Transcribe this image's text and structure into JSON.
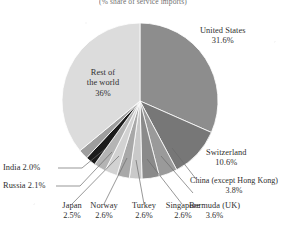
{
  "chart_data": {
    "type": "pie",
    "title": "(% share of service imports)",
    "xlabel": "",
    "ylabel": "",
    "legend_position": "none",
    "grid": false,
    "categories": [
      "United States",
      "Switzerland",
      "China (except Hong Kong)",
      "Bermuda (UK)",
      "Singapore",
      "Turkey",
      "Norway",
      "Japan",
      "Russia",
      "India",
      "Rest of the world"
    ],
    "values": [
      31.6,
      10.6,
      3.8,
      3.6,
      2.6,
      2.6,
      2.6,
      2.5,
      2.1,
      2.0,
      36.0
    ],
    "value_labels": [
      "31.6%",
      "10.6%",
      "3.8%",
      "3.6%",
      "2.6%",
      "2.6%",
      "2.6%",
      "2.5%",
      "2.1%",
      "2.0%",
      "36%"
    ],
    "colors": [
      "#8d8d8d",
      "#777777",
      "#9a9a9a",
      "#8a8a8a",
      "#c9c9c9",
      "#a8a8a8",
      "#d2d2d2",
      "#b4b4b4",
      "#1b1b1b",
      "#9e9e9e",
      "#dcdcdc"
    ],
    "start_angle_deg": 0,
    "direction": "clockwise"
  },
  "slices": {
    "united_states": {
      "name": "United States",
      "pct": "31.6%"
    },
    "switzerland": {
      "name": "Switzerland",
      "pct": "10.6%"
    },
    "china": {
      "name": "China (except Hong Kong)",
      "pct": "3.8%"
    },
    "bermuda": {
      "name": "Bermuda (UK)",
      "pct": "3.6%"
    },
    "singapore": {
      "name": "Singapore",
      "pct": "2.6%"
    },
    "turkey": {
      "name": "Turkey",
      "pct": "2.6%"
    },
    "norway": {
      "name": "Norway",
      "pct": "2.6%"
    },
    "japan": {
      "name": "Japan",
      "pct": "2.5%"
    },
    "russia": {
      "name": "Russia 2.1%",
      "pct": "2.1%"
    },
    "india": {
      "name": "India 2.0%",
      "pct": "2.0%"
    },
    "rest": {
      "line1": "Rest of",
      "line2": "the world",
      "pct": "36%"
    }
  }
}
